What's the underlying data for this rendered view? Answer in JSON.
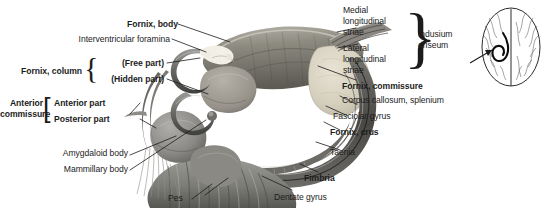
{
  "figure": {
    "background_color": "#ffffff",
    "text_color": "#1c1c1c",
    "width": 557,
    "height": 211
  },
  "labels": {
    "fornix_body": "Fornix, body",
    "interventricular_foramina": "Interventricular foramina",
    "free_part": "(Free part)",
    "hidden_part": "(Hidden part)",
    "fornix_column": "Fornix, column",
    "anterior_part": "Anterior part",
    "posterior_part": "Posterior part",
    "anterior_commissure_l1": "Anterior",
    "anterior_commissure_l2": "commissure",
    "amygdaloid_body": "Amygdaloid body",
    "mammillary_body": "Mammillary body",
    "pes": "Pes",
    "medial_striae_l1": "Medial",
    "medial_striae_l2": "longitudinal",
    "medial_striae_l3": "striae",
    "lateral_striae_l1": "Lateral",
    "lateral_striae_l2": "longitudinal",
    "lateral_striae_l3": "striae",
    "indusium_l1": "Indusium",
    "indusium_l2": "griseum",
    "fornix_commissure": "Fornix, commissure",
    "corpus_callosum_splenium": "Corpus callosum, splenium",
    "fasciolar_gyrus": "Fasciolar gyrus",
    "fornix_crus": "Fornix, crus",
    "taenia": "Taenia",
    "fimbria": "Fimbria",
    "dentate_gyrus": "Dentate gyrus"
  },
  "braces": {
    "fornix_column": "{",
    "anterior_commissure": "[",
    "indusium_griseum": "}"
  },
  "inset": {
    "name": "brain-superior-view-orientation-inset",
    "arrow": "pointer-arrow-to-fornix"
  },
  "colors": {
    "fornix_dark": "#4a4a4a",
    "fornix_mid": "#6f6f6f",
    "corpus_callosum": "#7b7b76",
    "splenium_light": "#d9d4c4",
    "amygdala": "#8d8d8a",
    "pes_band": "#8a8a85",
    "thalamus": "#a09c92",
    "leader_line": "#1c1c1c"
  }
}
